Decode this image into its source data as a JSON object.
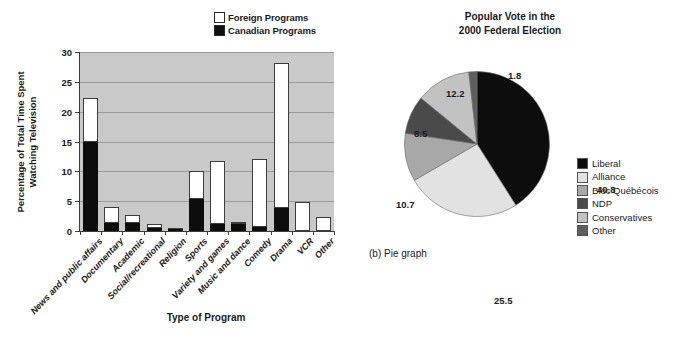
{
  "bar_panel": {
    "legend": [
      {
        "label": "Foreign Programs",
        "swatch": "#ffffff",
        "icon": "legend-swatch-foreign"
      },
      {
        "label": "Canadian Programs",
        "swatch": "#111111",
        "icon": "legend-swatch-canadian"
      }
    ],
    "ylabel_line1": "Percentage of Total Time Spent",
    "ylabel_line2": "Watching Television",
    "xlabel": "Type of Program"
  },
  "pie_panel": {
    "title_line1": "Popular Vote in the",
    "title_line2": "2000 Federal Election",
    "caption": "(b) Pie graph",
    "legend": [
      {
        "label": "Liberal",
        "color": "#0d0d0d"
      },
      {
        "label": "Alliance",
        "color": "#e2e2e2"
      },
      {
        "label": "Bloc Québécois",
        "color": "#a8a8a8"
      },
      {
        "label": "NDP",
        "color": "#4a4a4a"
      },
      {
        "label": "Conservatives",
        "color": "#c2c2c2"
      },
      {
        "label": "Other",
        "color": "#5e5e5e"
      }
    ]
  },
  "chart_data": [
    {
      "type": "bar",
      "subtype": "stacked-vertical",
      "title": "",
      "xlabel": "Type of Program",
      "ylabel": "Percentage of Total Time Spent Watching Television",
      "ylim": [
        0,
        30
      ],
      "yticks": [
        0,
        5,
        10,
        15,
        20,
        25,
        30
      ],
      "grid": true,
      "plot_background": "#c9c9c9",
      "legend_position": "top-right",
      "categories": [
        "News and public affairs",
        "Documentary",
        "Academic",
        "Social/recreational",
        "Religion",
        "Sports",
        "Variety and games",
        "Music and dance",
        "Comedy",
        "Drama",
        "VCR",
        "Other"
      ],
      "series": [
        {
          "name": "Canadian Programs",
          "color": "#0d0d0d",
          "values": [
            15.0,
            1.4,
            1.4,
            0.5,
            0.2,
            5.3,
            1.2,
            1.1,
            0.6,
            3.8,
            0.0,
            0.0
          ]
        },
        {
          "name": "Foreign Programs",
          "color": "#ffffff",
          "values": [
            7.3,
            2.6,
            1.3,
            0.7,
            0.1,
            4.8,
            10.5,
            0.4,
            11.4,
            24.3,
            4.9,
            2.4
          ]
        }
      ],
      "totals": [
        22.3,
        4.0,
        2.7,
        1.2,
        0.3,
        10.1,
        11.7,
        1.5,
        12.0,
        28.1,
        4.9,
        2.4
      ]
    },
    {
      "type": "pie",
      "title": "Popular Vote in the 2000 Federal Election",
      "labels": [
        "Liberal",
        "Alliance",
        "Bloc Québécois",
        "NDP",
        "Conservatives",
        "Other"
      ],
      "values": [
        40.8,
        25.5,
        10.7,
        8.5,
        12.2,
        1.8
      ],
      "colors": [
        "#0d0d0d",
        "#e2e2e2",
        "#a8a8a8",
        "#4a4a4a",
        "#c2c2c2",
        "#5e5e5e"
      ],
      "start_angle_deg": 0,
      "direction": "clockwise",
      "legend_position": "right",
      "value_labels": [
        {
          "text": "40.8",
          "left": 193,
          "top": 113
        },
        {
          "text": "25.5",
          "left": 90,
          "top": 224
        },
        {
          "text": "10.7",
          "left": -8,
          "top": 128
        },
        {
          "text": "8.5",
          "left": 10,
          "top": 57
        },
        {
          "text": "12.2",
          "left": 42,
          "top": 17
        },
        {
          "text": "1.8",
          "left": 104,
          "top": -1
        }
      ]
    }
  ]
}
